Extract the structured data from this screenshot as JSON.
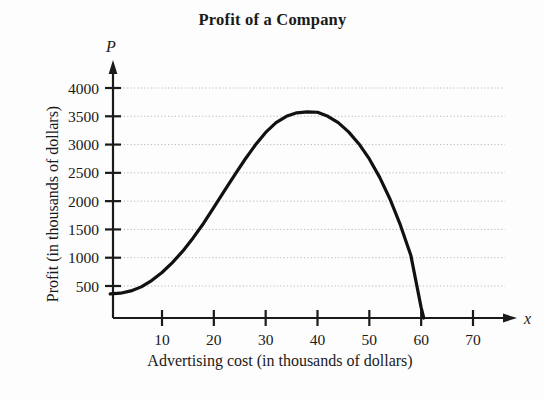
{
  "chart_data": {
    "type": "line",
    "title": "Profit of a Company",
    "xlabel": "Advertising cost (in thousands of dollars)",
    "ylabel": "Profit (in thousands of dollars)",
    "x_axis_variable": "x",
    "y_axis_variable": "P",
    "xlim": [
      0,
      75
    ],
    "ylim": [
      0,
      4250
    ],
    "grid": true,
    "grid_style": "dotted-horizontal",
    "legend": "none",
    "xticks": [
      10,
      20,
      30,
      40,
      50,
      60,
      70
    ],
    "xtick_labels": [
      "10",
      "20",
      "30",
      "40",
      "50",
      "60",
      "70"
    ],
    "yticks": [
      500,
      1000,
      1500,
      2000,
      2500,
      3000,
      3500,
      4000
    ],
    "ytick_labels": [
      "500",
      "1000",
      "1500",
      "2000",
      "2500",
      "3000",
      "3500",
      "4000"
    ],
    "series": [
      {
        "name": "Profit",
        "color": "#111111",
        "x": [
          0,
          2,
          4,
          6,
          8,
          10,
          12,
          14,
          16,
          18,
          20,
          22,
          24,
          26,
          28,
          30,
          32,
          34,
          36,
          38,
          40,
          42,
          44,
          46,
          48,
          50,
          52,
          54,
          56,
          58,
          60,
          60.5
        ],
        "y": [
          420,
          430,
          470,
          540,
          650,
          790,
          960,
          1160,
          1390,
          1640,
          1920,
          2200,
          2480,
          2750,
          3000,
          3220,
          3390,
          3500,
          3560,
          3575,
          3570,
          3500,
          3390,
          3230,
          3020,
          2760,
          2440,
          2060,
          1610,
          1090,
          180,
          0
        ]
      }
    ],
    "peak": {
      "x": 40,
      "y": 3570
    },
    "x_intercept": 60.5,
    "y_intercept": 420
  },
  "geometry": {
    "plot_left": 113,
    "plot_right": 505,
    "axis_baseline_y": 318,
    "y_top": 88,
    "px_per_x_unit": 5.22,
    "px_per_500": 28.3
  }
}
